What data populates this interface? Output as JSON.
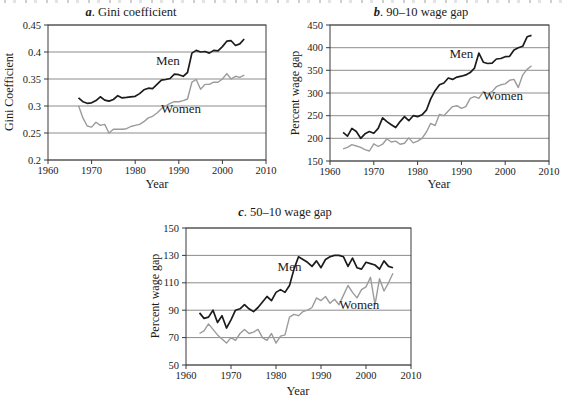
{
  "colors": {
    "men": "#1c1c1c",
    "women": "#9b9b9b",
    "grid": "#6e6e6e",
    "axis": "#3a3a3a"
  },
  "chart_data": [
    {
      "id": "a",
      "type": "line",
      "title_prefix": "a",
      "title_rest": ". Gini coefficient",
      "ylabel": "Gini Coefficient",
      "xlabel": "Year",
      "xlim": [
        1960,
        2010
      ],
      "ylim": [
        0.2,
        0.45
      ],
      "xticks": [
        1960,
        1970,
        1980,
        1990,
        2000,
        2010
      ],
      "yticks": [
        {
          "v": 0.2,
          "label": "0.2"
        },
        {
          "v": 0.25,
          "label": "0.25"
        },
        {
          "v": 0.3,
          "label": "0.3"
        },
        {
          "v": 0.35,
          "label": "0.35"
        },
        {
          "v": 0.4,
          "label": "0.4"
        },
        {
          "v": 0.45,
          "label": "0.45"
        }
      ],
      "grid": true,
      "legend": "inline-labels",
      "x": [
        1967,
        1968,
        1969,
        1970,
        1971,
        1972,
        1973,
        1974,
        1975,
        1976,
        1977,
        1978,
        1979,
        1980,
        1981,
        1982,
        1983,
        1984,
        1985,
        1986,
        1987,
        1988,
        1989,
        1990,
        1991,
        1992,
        1993,
        1994,
        1995,
        1996,
        1997,
        1998,
        1999,
        2000,
        2001,
        2002,
        2003,
        2004,
        2005
      ],
      "series": [
        {
          "name": "Men",
          "color": "#1c1c1c",
          "width": 1.7,
          "label": {
            "text": "Men",
            "x": 1987.5,
            "y": 0.376
          },
          "values": [
            0.315,
            0.308,
            0.305,
            0.306,
            0.31,
            0.317,
            0.311,
            0.309,
            0.312,
            0.319,
            0.315,
            0.316,
            0.317,
            0.318,
            0.323,
            0.33,
            0.333,
            0.332,
            0.34,
            0.348,
            0.349,
            0.351,
            0.359,
            0.358,
            0.355,
            0.362,
            0.398,
            0.403,
            0.4,
            0.401,
            0.398,
            0.403,
            0.402,
            0.41,
            0.42,
            0.421,
            0.412,
            0.415,
            0.424
          ]
        },
        {
          "name": "Women",
          "color": "#9b9b9b",
          "width": 1.4,
          "label": {
            "text": "Women",
            "x": 1990.5,
            "y": 0.288
          },
          "values": [
            0.301,
            0.278,
            0.263,
            0.261,
            0.27,
            0.264,
            0.266,
            0.25,
            0.257,
            0.257,
            0.257,
            0.258,
            0.262,
            0.264,
            0.266,
            0.271,
            0.278,
            0.281,
            0.287,
            0.295,
            0.3,
            0.305,
            0.308,
            0.308,
            0.31,
            0.313,
            0.344,
            0.349,
            0.331,
            0.34,
            0.34,
            0.344,
            0.344,
            0.35,
            0.36,
            0.35,
            0.355,
            0.353,
            0.357
          ]
        }
      ]
    },
    {
      "id": "b",
      "type": "line",
      "title_prefix": "b",
      "title_rest": ". 90–10 wage gap",
      "ylabel": "Percent wage gap",
      "xlabel": "Year",
      "xlim": [
        1960,
        2010
      ],
      "ylim": [
        150,
        450
      ],
      "xticks": [
        1960,
        1970,
        1980,
        1990,
        2000,
        2010
      ],
      "yticks": [
        {
          "v": 150,
          "label": "150"
        },
        {
          "v": 200,
          "label": "200"
        },
        {
          "v": 250,
          "label": "250"
        },
        {
          "v": 300,
          "label": "300"
        },
        {
          "v": 350,
          "label": "350"
        },
        {
          "v": 400,
          "label": "400"
        },
        {
          "v": 450,
          "label": "450"
        }
      ],
      "grid": true,
      "legend": "inline-labels",
      "x": [
        1963,
        1964,
        1965,
        1966,
        1967,
        1968,
        1969,
        1970,
        1971,
        1972,
        1973,
        1974,
        1975,
        1976,
        1977,
        1978,
        1979,
        1980,
        1981,
        1982,
        1983,
        1984,
        1985,
        1986,
        1987,
        1988,
        1989,
        1990,
        1991,
        1992,
        1993,
        1994,
        1995,
        1996,
        1997,
        1998,
        1999,
        2000,
        2001,
        2002,
        2003,
        2004,
        2005,
        2006
      ],
      "series": [
        {
          "name": "Men",
          "color": "#1c1c1c",
          "width": 1.7,
          "label": {
            "text": "Men",
            "x": 1990,
            "y": 377
          },
          "values": [
            213,
            205,
            222,
            215,
            200,
            210,
            215,
            211,
            222,
            245,
            237,
            230,
            224,
            237,
            248,
            239,
            250,
            248,
            252,
            262,
            287,
            305,
            318,
            322,
            333,
            330,
            335,
            337,
            340,
            345,
            355,
            388,
            368,
            365,
            366,
            375,
            376,
            380,
            381,
            395,
            400,
            403,
            424,
            427
          ]
        },
        {
          "name": "Women",
          "color": "#9b9b9b",
          "width": 1.4,
          "label": {
            "text": "Women",
            "x": 1999.5,
            "y": 285
          },
          "values": [
            177,
            180,
            186,
            183,
            180,
            175,
            172,
            188,
            182,
            187,
            199,
            192,
            194,
            187,
            189,
            201,
            190,
            194,
            200,
            214,
            233,
            228,
            253,
            250,
            260,
            270,
            272,
            266,
            270,
            288,
            292,
            288,
            303,
            298,
            303,
            314,
            318,
            320,
            328,
            330,
            312,
            340,
            352,
            360
          ]
        }
      ]
    },
    {
      "id": "c",
      "type": "line",
      "title_prefix": "c",
      "title_rest": ". 50–10 wage gap",
      "ylabel": "Percent wage gap",
      "xlabel": "Year",
      "xlim": [
        1960,
        2010
      ],
      "ylim": [
        50,
        150
      ],
      "xticks": [
        1960,
        1970,
        1980,
        1990,
        2000,
        2010
      ],
      "yticks": [
        {
          "v": 50,
          "label": "50"
        },
        {
          "v": 70,
          "label": "70"
        },
        {
          "v": 90,
          "label": "90"
        },
        {
          "v": 110,
          "label": "110"
        },
        {
          "v": 130,
          "label": "130"
        },
        {
          "v": 150,
          "label": "150"
        }
      ],
      "grid": true,
      "legend": "inline-labels",
      "x": [
        1963,
        1964,
        1965,
        1966,
        1967,
        1968,
        1969,
        1970,
        1971,
        1972,
        1973,
        1974,
        1975,
        1976,
        1977,
        1978,
        1979,
        1980,
        1981,
        1982,
        1983,
        1984,
        1985,
        1986,
        1987,
        1988,
        1989,
        1990,
        1991,
        1992,
        1993,
        1994,
        1995,
        1996,
        1997,
        1998,
        1999,
        2000,
        2001,
        2002,
        2003,
        2004,
        2005,
        2006
      ],
      "series": [
        {
          "name": "Men",
          "color": "#1c1c1c",
          "width": 1.7,
          "label": {
            "text": "Men",
            "x": 1983,
            "y": 119
          },
          "values": [
            88,
            84,
            85,
            90,
            81,
            86,
            77,
            83,
            90,
            91,
            94,
            91,
            89,
            92,
            96,
            100,
            97,
            103,
            105,
            103,
            108,
            120,
            129,
            127,
            125,
            122,
            126,
            121,
            127,
            129,
            130,
            130,
            129,
            122,
            128,
            121,
            120,
            125,
            124,
            123,
            120,
            126,
            122,
            121
          ]
        },
        {
          "name": "Women",
          "color": "#9b9b9b",
          "width": 1.4,
          "label": {
            "text": "Women",
            "x": 1998.5,
            "y": 91
          },
          "values": [
            73,
            75,
            80,
            76,
            72,
            69,
            66,
            70,
            68,
            73,
            76,
            73,
            74,
            76,
            70,
            68,
            73,
            66,
            71,
            72,
            85,
            87,
            86,
            89,
            90,
            92,
            99,
            97,
            100,
            95,
            98,
            94,
            101,
            108,
            103,
            99,
            105,
            107,
            114,
            94,
            113,
            104,
            110,
            117
          ]
        }
      ]
    }
  ]
}
